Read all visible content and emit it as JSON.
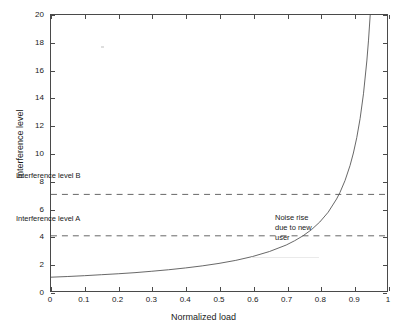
{
  "chart_data": {
    "type": "line",
    "title": "",
    "xlabel": "Normalized load",
    "ylabel": "Interference level",
    "xlim": [
      0,
      1
    ],
    "ylim": [
      0,
      20
    ],
    "grid": false,
    "legend": "none",
    "xticks": [
      "0",
      "0.1",
      "0.2",
      "0.3",
      "0.4",
      "0.5",
      "0.6",
      "0.7",
      "0.8",
      "0.9",
      "1"
    ],
    "xtick_values": [
      0,
      0.1,
      0.2,
      0.3,
      0.4,
      0.5,
      0.6,
      0.7,
      0.8,
      0.9,
      1
    ],
    "yticks": [
      "0",
      "2",
      "4",
      "6",
      "8",
      "10",
      "12",
      "14",
      "16",
      "18",
      "20"
    ],
    "ytick_values": [
      0,
      2,
      4,
      6,
      8,
      10,
      12,
      14,
      16,
      18,
      20
    ],
    "series": [
      {
        "name": "Noise rise curve",
        "style": "solid",
        "color": "#555555",
        "formula": "y = 1 / (1 - x)",
        "x": [
          0.0,
          0.05,
          0.1,
          0.15,
          0.2,
          0.25,
          0.3,
          0.35,
          0.4,
          0.45,
          0.5,
          0.55,
          0.6,
          0.65,
          0.7,
          0.725,
          0.75,
          0.775,
          0.8,
          0.825,
          0.85,
          0.86,
          0.875,
          0.89,
          0.9,
          0.91,
          0.92,
          0.93,
          0.94,
          0.945,
          0.95
        ],
        "values": [
          1.0,
          1.05,
          1.11,
          1.18,
          1.25,
          1.33,
          1.43,
          1.54,
          1.67,
          1.82,
          2.0,
          2.22,
          2.5,
          2.86,
          3.33,
          3.64,
          4.0,
          4.44,
          5.0,
          5.71,
          6.67,
          7.14,
          8.0,
          9.09,
          10.0,
          11.11,
          12.5,
          14.29,
          16.67,
          18.18,
          20.0
        ]
      }
    ],
    "threshold_lines": [
      {
        "name": "Interference level B",
        "value": 7,
        "style": "dashed",
        "color": "#555555"
      },
      {
        "name": "Interference level A",
        "value": 4,
        "style": "dashed",
        "color": "#555555"
      }
    ],
    "annotations": [
      {
        "name": "Interference level B",
        "text": "Interference level B",
        "x": 0.05,
        "y": 7.9
      },
      {
        "name": "Interference level A",
        "text": "Interference level A",
        "x": 0.05,
        "y": 4.8
      },
      {
        "name": "Noise rise due to new user",
        "text": "Noise rise\ndue to new\nuser",
        "x": 0.87,
        "y": 5.6
      }
    ]
  },
  "chart": {
    "x_axis_title": "Normalized load",
    "y_axis_title": "Interference level",
    "annotation_level_b": "Interference level B",
    "annotation_level_a": "Interference level A",
    "annotation_noise_rise": "Noise rise\ndue to new\nuser"
  }
}
